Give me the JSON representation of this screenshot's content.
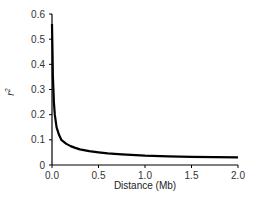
{
  "chart_data": {
    "type": "line",
    "title": "",
    "xlabel": "Distance (Mb)",
    "ylabel": "r2",
    "ylabel_base": "r",
    "ylabel_sup": "2",
    "xlim": [
      0,
      2.0
    ],
    "ylim": [
      0,
      0.6
    ],
    "grid": false,
    "legend": null,
    "x_ticks": [
      "0.0",
      "0.5",
      "1.0",
      "1.5",
      "2.0"
    ],
    "y_ticks": [
      "0",
      "0.1",
      "0.2",
      "0.3",
      "0.4",
      "0.5",
      "0.6"
    ],
    "series": [
      {
        "name": "LD decay",
        "color": "#000000",
        "x": [
          0.0,
          0.005,
          0.01,
          0.02,
          0.03,
          0.05,
          0.075,
          0.1,
          0.15,
          0.2,
          0.25,
          0.3,
          0.4,
          0.5,
          0.6,
          0.75,
          1.0,
          1.25,
          1.5,
          1.75,
          2.0
        ],
        "y": [
          0.56,
          0.45,
          0.35,
          0.25,
          0.2,
          0.15,
          0.12,
          0.1,
          0.085,
          0.075,
          0.068,
          0.062,
          0.055,
          0.05,
          0.046,
          0.042,
          0.037,
          0.034,
          0.032,
          0.031,
          0.03
        ]
      }
    ]
  }
}
